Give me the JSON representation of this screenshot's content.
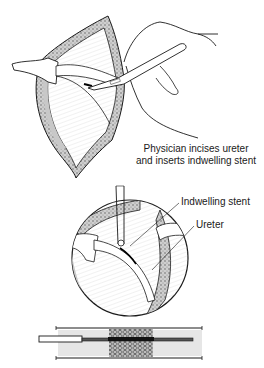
{
  "figure": {
    "caption": {
      "line1": "Physician incises ureter",
      "line2": "and inserts indwelling stent"
    },
    "callouts": [
      {
        "label": "Indwelling stent"
      },
      {
        "label": "Ureter"
      }
    ],
    "panels": [
      "Open incision with hand holding scalpel",
      "Magnified circular view of ureter with stent",
      "Cross-section of stent within ureter"
    ],
    "colors": {
      "line": "#1a1a1a",
      "shade": "#d9d9d9",
      "tissue": "#bdbdbd",
      "background": "#ffffff"
    }
  }
}
